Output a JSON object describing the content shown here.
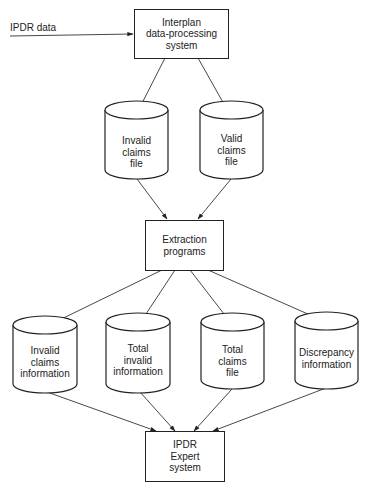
{
  "diagram": {
    "input_label": "IPDR data",
    "nodes": {
      "interplan": {
        "type": "process",
        "label": "Interplan\ndata-processing\nsystem"
      },
      "invalid_claims_file": {
        "type": "datastore",
        "label": "Invalid\nclaims\nfile"
      },
      "valid_claims_file": {
        "type": "datastore",
        "label": "Valid\nclaims\nfile"
      },
      "extraction": {
        "type": "process",
        "label": "Extraction\nprograms"
      },
      "invalid_claims_info": {
        "type": "datastore",
        "label": "Invalid\nclaims\ninformation"
      },
      "total_invalid_info": {
        "type": "datastore",
        "label": "Total\ninvalid\ninformation"
      },
      "total_claims_file": {
        "type": "datastore",
        "label": "Total\nclaims\nfile"
      },
      "discrepancy_info": {
        "type": "datastore",
        "label": "Discrepancy\ninformation"
      },
      "ipdr_expert": {
        "type": "process",
        "label": "IPDR\nExpert\nsystem"
      }
    },
    "edges": [
      {
        "from": "IPDR data",
        "to": "interplan"
      },
      {
        "from": "interplan",
        "to": "invalid_claims_file"
      },
      {
        "from": "interplan",
        "to": "valid_claims_file"
      },
      {
        "from": "invalid_claims_file",
        "to": "extraction"
      },
      {
        "from": "valid_claims_file",
        "to": "extraction"
      },
      {
        "from": "extraction",
        "to": "invalid_claims_info"
      },
      {
        "from": "extraction",
        "to": "total_invalid_info"
      },
      {
        "from": "extraction",
        "to": "total_claims_file"
      },
      {
        "from": "extraction",
        "to": "discrepancy_info"
      },
      {
        "from": "invalid_claims_info",
        "to": "ipdr_expert"
      },
      {
        "from": "total_invalid_info",
        "to": "ipdr_expert"
      },
      {
        "from": "total_claims_file",
        "to": "ipdr_expert"
      },
      {
        "from": "discrepancy_info",
        "to": "ipdr_expert"
      }
    ]
  }
}
